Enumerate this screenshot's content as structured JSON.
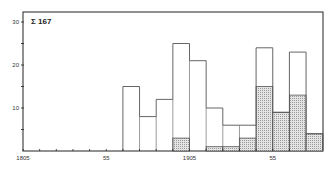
{
  "chart_data": {
    "type": "bar",
    "subtype": "stacked-histogram-overlay",
    "title": "",
    "annotation": "Σ 167",
    "annotation_parts": {
      "symbol": "Σ",
      "value": "167"
    },
    "xlabel": "",
    "ylabel": "",
    "xlim": [
      1805,
      1965
    ],
    "ylim": [
      0,
      32
    ],
    "grid": false,
    "legend": null,
    "x_tick_labels": [
      {
        "value": 1805,
        "label": "1805"
      },
      {
        "value": 1855,
        "label": "55"
      },
      {
        "value": 1905,
        "label": "1905"
      },
      {
        "value": 1955,
        "label": "55"
      }
    ],
    "x_minor_ticks": [
      1815,
      1825,
      1835,
      1845,
      1865,
      1875,
      1885,
      1895,
      1915,
      1925,
      1935,
      1945,
      1965
    ],
    "y_tick_labels": [
      {
        "value": 10,
        "label": "10"
      },
      {
        "value": 20,
        "label": "20"
      },
      {
        "value": 30,
        "label": "30"
      }
    ],
    "y_minor_ticks": [
      5,
      15,
      25
    ],
    "bin_width": 10,
    "bins": [
      [
        1865,
        1875
      ],
      [
        1875,
        1885
      ],
      [
        1885,
        1895
      ],
      [
        1895,
        1905
      ],
      [
        1905,
        1915
      ],
      [
        1915,
        1925
      ],
      [
        1925,
        1935
      ],
      [
        1935,
        1945
      ],
      [
        1945,
        1955
      ],
      [
        1955,
        1965
      ],
      [
        1965,
        1975
      ],
      [
        1975,
        1985
      ]
    ],
    "series": [
      {
        "name": "total (outline)",
        "style": "outline",
        "values": [
          15,
          8,
          12,
          25,
          21,
          10,
          6,
          6,
          24,
          9,
          23,
          4
        ]
      },
      {
        "name": "subset (shaded)",
        "style": "stippled",
        "values": [
          0,
          0,
          0,
          3,
          0,
          1,
          1,
          3,
          15,
          9,
          13,
          4
        ]
      }
    ]
  },
  "colors": {
    "axis": "#222222",
    "outline": "#555555",
    "shade": "#d8d8d8",
    "shade_dot": "#9a9a9a",
    "background": "#ffffff"
  }
}
